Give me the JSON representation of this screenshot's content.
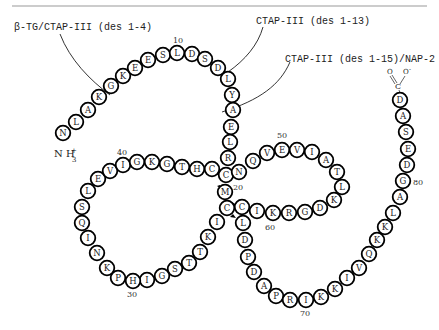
{
  "labels": {
    "beta_tg": "β-TG/CTAP-III (des 1-4)",
    "ctap_13": "CTAP-III (des 1-13)",
    "ctap_15": "CTAP-III (des 1-15)/NAP-2",
    "n_terminus": "NH3+",
    "c_terminus": "C O O-"
  },
  "numbers": {
    "n10": "10",
    "n20": "20",
    "n30": "30",
    "n40": "40",
    "n50": "50",
    "n60": "60",
    "n70": "70",
    "n80": "80"
  },
  "colors": {
    "stroke": "#000000",
    "fill": "#ffffff",
    "text": "#222222",
    "rule": "#999999"
  },
  "residues": [
    {
      "aa": "N",
      "x": 63,
      "y": 133
    },
    {
      "aa": "L",
      "x": 76,
      "y": 122
    },
    {
      "aa": "A",
      "x": 88,
      "y": 110
    },
    {
      "aa": "K",
      "x": 99,
      "y": 97
    },
    {
      "aa": "G",
      "x": 111,
      "y": 86
    },
    {
      "aa": "K",
      "x": 123,
      "y": 76
    },
    {
      "aa": "E",
      "x": 135,
      "y": 68
    },
    {
      "aa": "E",
      "x": 148,
      "y": 60
    },
    {
      "aa": "S",
      "x": 163,
      "y": 55
    },
    {
      "aa": "L",
      "x": 177,
      "y": 53
    },
    {
      "aa": "D",
      "x": 192,
      "y": 54
    },
    {
      "aa": "S",
      "x": 205,
      "y": 59
    },
    {
      "aa": "D",
      "x": 218,
      "y": 68
    },
    {
      "aa": "L",
      "x": 228,
      "y": 79
    },
    {
      "aa": "Y",
      "x": 232,
      "y": 95
    },
    {
      "aa": "A",
      "x": 233,
      "y": 110
    },
    {
      "aa": "E",
      "x": 231,
      "y": 127
    },
    {
      "aa": "L",
      "x": 230,
      "y": 142
    },
    {
      "aa": "R",
      "x": 228,
      "y": 158
    },
    {
      "aa": "C",
      "x": 226,
      "y": 175
    },
    {
      "aa": "N",
      "x": 239,
      "y": 172
    },
    {
      "aa": "Q",
      "x": 253,
      "y": 161
    },
    {
      "aa": "V",
      "x": 267,
      "y": 153
    },
    {
      "aa": "E",
      "x": 282,
      "y": 150
    },
    {
      "aa": "V",
      "x": 297,
      "y": 150
    },
    {
      "aa": "I",
      "x": 312,
      "y": 152
    },
    {
      "aa": "A",
      "x": 326,
      "y": 160
    },
    {
      "aa": "T",
      "x": 337,
      "y": 172
    },
    {
      "aa": "L",
      "x": 342,
      "y": 187
    },
    {
      "aa": "K",
      "x": 334,
      "y": 200
    },
    {
      "aa": "D",
      "x": 320,
      "y": 208
    },
    {
      "aa": "G",
      "x": 305,
      "y": 212
    },
    {
      "aa": "R",
      "x": 289,
      "y": 213
    },
    {
      "aa": "K",
      "x": 273,
      "y": 213
    },
    {
      "aa": "I",
      "x": 257,
      "y": 211
    },
    {
      "aa": "C",
      "x": 242,
      "y": 207
    },
    {
      "aa": "M",
      "x": 225,
      "y": 192
    },
    {
      "aa": "C",
      "x": 227,
      "y": 208
    },
    {
      "aa": "I",
      "x": 217,
      "y": 222
    },
    {
      "aa": "K",
      "x": 208,
      "y": 237
    },
    {
      "aa": "T",
      "x": 200,
      "y": 252
    },
    {
      "aa": "T",
      "x": 189,
      "y": 263
    },
    {
      "aa": "S",
      "x": 175,
      "y": 269
    },
    {
      "aa": "G",
      "x": 162,
      "y": 276
    },
    {
      "aa": "I",
      "x": 147,
      "y": 280
    },
    {
      "aa": "H",
      "x": 133,
      "y": 281
    },
    {
      "aa": "P",
      "x": 118,
      "y": 278
    },
    {
      "aa": "K",
      "x": 107,
      "y": 268
    },
    {
      "aa": "N",
      "x": 97,
      "y": 253
    },
    {
      "aa": "I",
      "x": 88,
      "y": 238
    },
    {
      "aa": "Q",
      "x": 82,
      "y": 223
    },
    {
      "aa": "S",
      "x": 82,
      "y": 207
    },
    {
      "aa": "L",
      "x": 88,
      "y": 191
    },
    {
      "aa": "E",
      "x": 98,
      "y": 179
    },
    {
      "aa": "V",
      "x": 110,
      "y": 171
    },
    {
      "aa": "I",
      "x": 123,
      "y": 165
    },
    {
      "aa": "G",
      "x": 137,
      "y": 162
    },
    {
      "aa": "K",
      "x": 152,
      "y": 162
    },
    {
      "aa": "G",
      "x": 167,
      "y": 164
    },
    {
      "aa": "T",
      "x": 182,
      "y": 167
    },
    {
      "aa": "H",
      "x": 197,
      "y": 169
    },
    {
      "aa": "C",
      "x": 212,
      "y": 169
    },
    {
      "aa": "L",
      "x": 243,
      "y": 223
    },
    {
      "aa": "D",
      "x": 245,
      "y": 240
    },
    {
      "aa": "P",
      "x": 248,
      "y": 257
    },
    {
      "aa": "D",
      "x": 254,
      "y": 272
    },
    {
      "aa": "A",
      "x": 264,
      "y": 286
    },
    {
      "aa": "P",
      "x": 276,
      "y": 296
    },
    {
      "aa": "R",
      "x": 290,
      "y": 300
    },
    {
      "aa": "I",
      "x": 306,
      "y": 300
    },
    {
      "aa": "K",
      "x": 321,
      "y": 297
    },
    {
      "aa": "K",
      "x": 335,
      "y": 289
    },
    {
      "aa": "I",
      "x": 347,
      "y": 278
    },
    {
      "aa": "V",
      "x": 359,
      "y": 268
    },
    {
      "aa": "Q",
      "x": 369,
      "y": 254
    },
    {
      "aa": "K",
      "x": 377,
      "y": 240
    },
    {
      "aa": "K",
      "x": 385,
      "y": 227
    },
    {
      "aa": "L",
      "x": 393,
      "y": 213
    },
    {
      "aa": "A",
      "x": 400,
      "y": 197
    },
    {
      "aa": "G",
      "x": 403,
      "y": 181
    },
    {
      "aa": "D",
      "x": 407,
      "y": 165
    },
    {
      "aa": "E",
      "x": 408,
      "y": 149
    },
    {
      "aa": "S",
      "x": 406,
      "y": 132
    },
    {
      "aa": "A",
      "x": 403,
      "y": 116
    },
    {
      "aa": "D",
      "x": 400,
      "y": 100
    }
  ]
}
